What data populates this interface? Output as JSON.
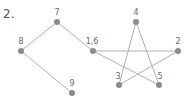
{
  "problem_number": "2.",
  "colors": {
    "edge": "#b0b0b0",
    "node": "#8a8a8a",
    "label": "#666666"
  },
  "nodes": [
    {
      "id": "8",
      "label": "8",
      "x": 21,
      "y": 51,
      "lx": 21,
      "ly": 44
    },
    {
      "id": "7",
      "label": "7",
      "x": 57,
      "y": 22,
      "lx": 57,
      "ly": 15
    },
    {
      "id": "1,6",
      "label": "1,6",
      "x": 93,
      "y": 51,
      "lx": 92,
      "ly": 44
    },
    {
      "id": "9",
      "label": "9",
      "x": 72,
      "y": 93,
      "lx": 72,
      "ly": 86
    },
    {
      "id": "4",
      "label": "4",
      "x": 136,
      "y": 22,
      "lx": 136,
      "ly": 15
    },
    {
      "id": "2",
      "label": "2",
      "x": 178,
      "y": 51,
      "lx": 178,
      "ly": 44
    },
    {
      "id": "3",
      "label": "3",
      "x": 119,
      "y": 85,
      "lx": 118,
      "ly": 79
    },
    {
      "id": "5",
      "label": "5",
      "x": 159,
      "y": 85,
      "lx": 160,
      "ly": 79
    }
  ],
  "edges": [
    [
      "8",
      "7"
    ],
    [
      "7",
      "1,6"
    ],
    [
      "8",
      "9"
    ],
    [
      "1,6",
      "2"
    ],
    [
      "1,6",
      "5"
    ],
    [
      "4",
      "3"
    ],
    [
      "4",
      "5"
    ],
    [
      "3",
      "2"
    ]
  ]
}
